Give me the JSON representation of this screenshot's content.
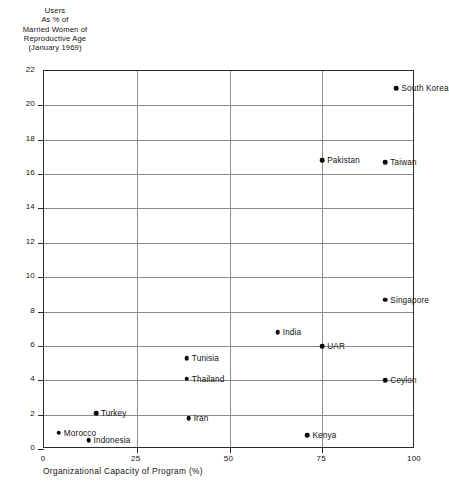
{
  "chart_data": {
    "type": "scatter",
    "title": "",
    "ylabel_lines": [
      "Users",
      "As % of",
      "Married Women of",
      "Reproductive Age",
      "(January 1969)"
    ],
    "xlabel": "Organizational Capacity of Program (%)",
    "xlim": [
      0,
      100
    ],
    "ylim": [
      0,
      22
    ],
    "xticks": [
      0,
      25,
      50,
      75,
      100
    ],
    "xtick_labels": [
      "0",
      "25",
      "50",
      "75",
      "100"
    ],
    "yticks": [
      0,
      2,
      4,
      6,
      8,
      10,
      12,
      14,
      16,
      18,
      20,
      22
    ],
    "ytick_labels": [
      "0",
      "2",
      "4",
      "6",
      "8",
      "10",
      "12",
      "14",
      "16",
      "18",
      "20",
      "22"
    ],
    "grid": "both",
    "legend": "none",
    "points": [
      {
        "label": "South Korea",
        "x": 95.0,
        "y": 21.0,
        "label_side": "right"
      },
      {
        "label": "Pakistan",
        "x": 75.0,
        "y": 16.8,
        "label_side": "right"
      },
      {
        "label": "Taiwan",
        "x": 92.0,
        "y": 16.7,
        "label_side": "right"
      },
      {
        "label": "Singapore",
        "x": 92.0,
        "y": 8.7,
        "label_side": "right"
      },
      {
        "label": "India",
        "x": 63.0,
        "y": 6.8,
        "label_side": "right"
      },
      {
        "label": "UAR",
        "x": 75.0,
        "y": 6.0,
        "label_side": "right"
      },
      {
        "label": "Tunisia",
        "x": 38.5,
        "y": 5.3,
        "label_side": "right"
      },
      {
        "label": "Thailand",
        "x": 38.5,
        "y": 4.1,
        "label_side": "right"
      },
      {
        "label": "Ceylon",
        "x": 92.0,
        "y": 4.0,
        "label_side": "right"
      },
      {
        "label": "Turkey",
        "x": 14.0,
        "y": 2.1,
        "label_side": "right"
      },
      {
        "label": "Iran",
        "x": 39.0,
        "y": 1.8,
        "label_side": "right"
      },
      {
        "label": "Morocco",
        "x": 4.0,
        "y": 0.95,
        "label_side": "right"
      },
      {
        "label": "Indonesia",
        "x": 12.0,
        "y": 0.5,
        "label_side": "right"
      },
      {
        "label": "Kenya",
        "x": 71.0,
        "y": 0.8,
        "label_side": "right"
      }
    ]
  },
  "colors": {
    "point": "#0b0b0b",
    "frame": "#2b2b2b",
    "grid": "#8c8c8c",
    "text": "#111111",
    "background": "#ffffff"
  }
}
